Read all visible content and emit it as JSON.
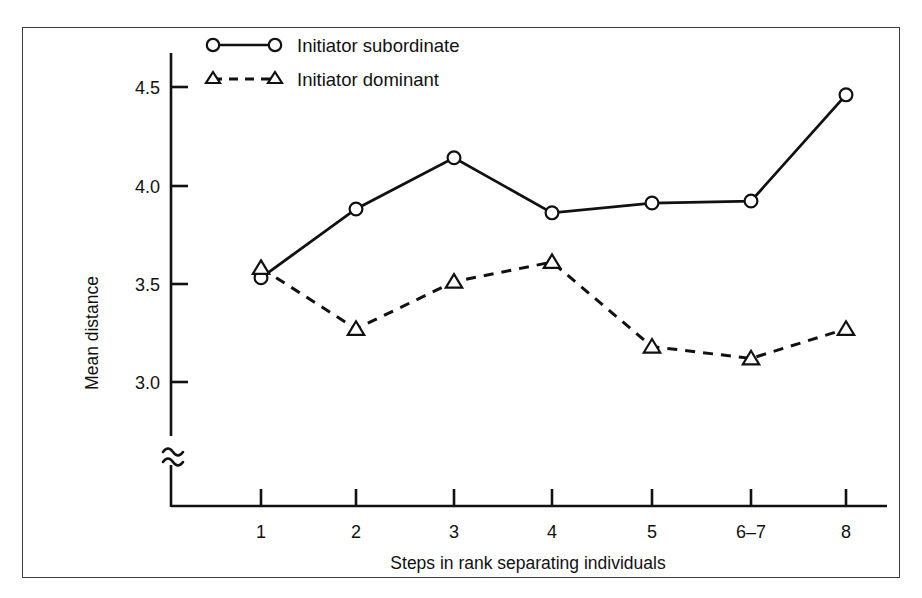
{
  "chart_data": {
    "type": "line",
    "title": "",
    "xlabel": "Steps in rank separating individuals",
    "ylabel": "Mean distance",
    "categories": [
      "1",
      "2",
      "3",
      "4",
      "5",
      "6–7",
      "8"
    ],
    "xtick_labels": [
      "1",
      "2",
      "3",
      "4",
      "5",
      "6–7",
      "8"
    ],
    "ytick_labels": [
      "3.0",
      "3.5",
      "4.0",
      "4.5"
    ],
    "ytick_values": [
      3.0,
      3.5,
      4.0,
      4.5
    ],
    "ylim": [
      2.78,
      4.62
    ],
    "axis_break": true,
    "axis_break_symbol": "≈",
    "grid": false,
    "legend_position": "top-left-inside",
    "series": [
      {
        "name": "Initiator subordinate",
        "marker": "circle-open",
        "linestyle": "solid",
        "color": "#111111",
        "values": [
          3.53,
          3.88,
          4.14,
          3.86,
          3.91,
          3.92,
          4.46
        ]
      },
      {
        "name": "Initiator dominant",
        "marker": "triangle-open",
        "linestyle": "dashed",
        "color": "#111111",
        "values": [
          3.58,
          3.27,
          3.51,
          3.61,
          3.18,
          3.12,
          3.27
        ]
      }
    ]
  },
  "legend": {
    "entries": [
      {
        "label": "Initiator subordinate",
        "marker": "circle-open",
        "linestyle": "solid"
      },
      {
        "label": "Initiator dominant",
        "marker": "triangle-open",
        "linestyle": "dashed"
      }
    ]
  },
  "colors": {
    "ink": "#111111",
    "frame": "#3a3a3a",
    "background": "#ffffff"
  }
}
